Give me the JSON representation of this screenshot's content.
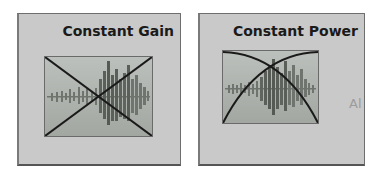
{
  "transitions": [
    {
      "id": "constant-gain",
      "label": "Constant Gain",
      "curve": "linear-crossfade"
    },
    {
      "id": "constant-power",
      "label": "Constant Power",
      "curve": "equal-power-crossfade"
    }
  ],
  "partial_label": "Al",
  "colors": {
    "panel_bg": "#c9c9c9",
    "border": "#6e6e6e",
    "thumb_bg_top": "#b8bcb8",
    "thumb_bg_bottom": "#9ea39e",
    "waveform": "#6b706b",
    "curve": "#1a1a1a"
  }
}
